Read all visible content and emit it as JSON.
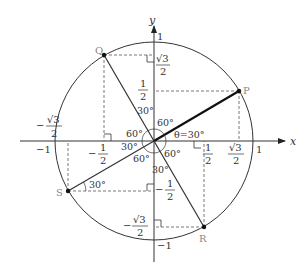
{
  "diagram": {
    "type": "unit-circle",
    "axes": {
      "x_label": "x",
      "y_label": "y"
    },
    "axis_ticks": {
      "x_pos": "1",
      "x_neg": "−1",
      "y_pos": "1",
      "y_neg": "−1"
    },
    "points": {
      "P": {
        "label": "P",
        "angle_deg": 30
      },
      "Q": {
        "label": "Q",
        "angle_deg": 120
      },
      "S": {
        "label": "S",
        "angle_deg": 210
      },
      "R": {
        "label": "R",
        "angle_deg": 300
      }
    },
    "theta_label": "θ=30°",
    "angle_labels": {
      "q_top": "30°",
      "q_right": "60°",
      "q_left": "60°",
      "s_left": "30°",
      "s_bottom": "60°",
      "r_right": "60°",
      "r_bottom": "30°",
      "s_point": "30°"
    },
    "coordinate_labels": {
      "sqrt3": "√3",
      "one": "1",
      "two": "2",
      "minus": "−"
    },
    "colors": {
      "stroke": "#333333",
      "dashed": "#555555",
      "point_label": "#888888"
    }
  }
}
